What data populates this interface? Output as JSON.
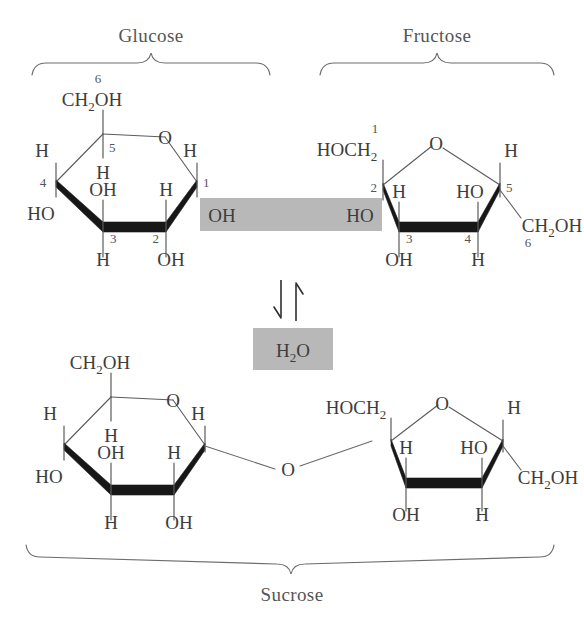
{
  "figure": {
    "title_top_left": "Glucose",
    "title_top_right": "Fructose",
    "title_bottom": "Sucrose",
    "water_label": "H",
    "water_sub": "2",
    "water_tail": "O",
    "highlight_color": "#b8b8b8",
    "background_color": "#ffffff",
    "ink_color": "#3d3d3d"
  },
  "glucose": {
    "name": "Glucose",
    "ring_oxygen": "O",
    "c6_label_main": "CH",
    "c6_label_sub": "2",
    "c6_label_tail": "OH",
    "locants": {
      "c1": "1",
      "c2": "2",
      "c3": "3",
      "c4": "4",
      "c5": "5",
      "c6": "6"
    },
    "substituents": {
      "c1_up": "H",
      "c1_down": "OH",
      "c2_up": "H",
      "c2_down": "OH",
      "c3_up": "OH",
      "c3_down": "H",
      "c4_up": "H",
      "c4_down": "HO",
      "c5_down": "H"
    }
  },
  "fructose": {
    "name": "Fructose",
    "ring_oxygen": "O",
    "c1_label_main": "HOCH",
    "c1_label_sub": "2",
    "c6_label_main": "CH",
    "c6_label_sub": "2",
    "c6_label_tail": "OH",
    "locants": {
      "c1": "1",
      "c2": "2",
      "c3": "3",
      "c4": "4",
      "c5": "5",
      "c6": "6"
    },
    "substituents": {
      "c2_down": "HO",
      "c3_up": "H",
      "c3_down": "OH",
      "c4_up": "HO",
      "c4_down": "H",
      "c5_up": "H"
    }
  },
  "reaction": {
    "highlight_left_group": "OH",
    "highlight_right_group": "HO",
    "equilibrium_arrows": "equilibrium-double-arrow",
    "byproduct_main": "H",
    "byproduct_sub": "2",
    "byproduct_tail": "O"
  },
  "sucrose": {
    "name": "Sucrose",
    "glycosidic_oxygen": "O",
    "glucose_unit": {
      "ring_oxygen": "O",
      "c6_label_main": "CH",
      "c6_label_sub": "2",
      "c6_label_tail": "OH",
      "substituents": {
        "c1_up": "H",
        "c2_up": "H",
        "c2_down": "OH",
        "c3_up": "OH",
        "c3_down": "H",
        "c4_up": "H",
        "c4_down": "HO",
        "c5_down": "H"
      }
    },
    "fructose_unit": {
      "ring_oxygen": "O",
      "c1_label_main": "HOCH",
      "c1_label_sub": "2",
      "c6_label_main": "CH",
      "c6_label_sub": "2",
      "c6_label_tail": "OH",
      "substituents": {
        "c3_up": "H",
        "c3_down": "OH",
        "c4_up": "HO",
        "c4_down": "H",
        "c5_up": "H"
      }
    }
  }
}
